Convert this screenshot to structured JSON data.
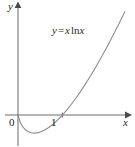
{
  "figure": {
    "background_color": "#ffffff",
    "width": 135,
    "height": 146
  },
  "axes": {
    "x_axis_label": "x",
    "y_axis_label": "y",
    "axis_color": "#6b6b6b",
    "x_axis_pixel_y": 115,
    "y_axis_pixel_x": 18,
    "x_ticks": [
      {
        "label": "0",
        "value": 0
      },
      {
        "label": "1",
        "value": 1
      }
    ],
    "y_ticks": []
  },
  "annotation": {
    "equation_full": "y = x ln x",
    "lhs": "y",
    "equals": "=",
    "rhs_var": "x",
    "rhs_fn": "ln",
    "rhs_arg": "x"
  },
  "chart_data": {
    "type": "line",
    "title": "",
    "subtitle": "",
    "xlabel": "x",
    "ylabel": "y",
    "legend": [
      "y = x ln x"
    ],
    "legend_position": "inside-top-center",
    "grid": false,
    "xlim": [
      -0.22,
      2.45
    ],
    "ylim": [
      -0.95,
      2.3
    ],
    "annotations": [
      {
        "text": "y = x ln x",
        "x": 0.95,
        "y": 1.75
      }
    ],
    "series": [
      {
        "name": "y = x ln x",
        "color": "#8c8c8c",
        "line_width": 1.1,
        "x": [
          0.0,
          0.05,
          0.1,
          0.15,
          0.2,
          0.25,
          0.3,
          0.3679,
          0.4,
          0.45,
          0.5,
          0.6,
          0.7,
          0.8,
          0.9,
          1.0,
          1.1,
          1.2,
          1.3,
          1.4,
          1.5,
          1.6,
          1.7,
          1.8,
          1.9,
          2.0,
          2.1,
          2.2,
          2.3,
          2.4
        ],
        "y": [
          0.0,
          -0.1498,
          -0.2303,
          -0.2846,
          -0.3219,
          -0.3466,
          -0.3612,
          -0.3679,
          -0.3665,
          -0.3594,
          -0.3466,
          -0.3065,
          -0.2497,
          -0.1785,
          -0.0948,
          0.0,
          0.1048,
          0.2188,
          0.3411,
          0.471,
          0.6082,
          0.752,
          0.9022,
          1.0583,
          1.2202,
          1.3863,
          1.5584,
          1.7345,
          1.9155,
          2.1006
        ]
      }
    ],
    "key_points": [
      {
        "label": "origin-crossing",
        "x": 0,
        "y": 0
      },
      {
        "label": "minimum",
        "x": 0.3679,
        "y": -0.3679
      },
      {
        "label": "x-intercept",
        "x": 1,
        "y": 0
      }
    ]
  }
}
